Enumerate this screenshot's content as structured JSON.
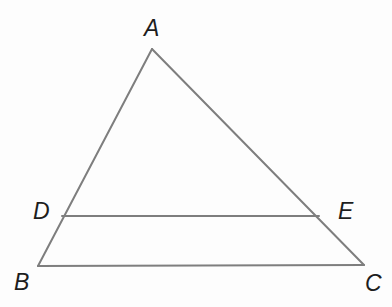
{
  "figure": {
    "kind": "geometry-diagram",
    "background_color": "#fdfdfd",
    "stroke_color": "#7e7e7e",
    "stroke_width": 2,
    "label_color": "#1d1d1d",
    "label_font_size": 23,
    "points": {
      "A": {
        "label": "A",
        "x": 152,
        "y": 49
      },
      "B": {
        "label": "B",
        "x": 38,
        "y": 266
      },
      "C": {
        "label": "C",
        "x": 364,
        "y": 265
      },
      "D": {
        "label": "D",
        "x": 62,
        "y": 216
      },
      "E": {
        "label": "E",
        "x": 319,
        "y": 216
      }
    },
    "segments": [
      {
        "name": "AB",
        "from": "A",
        "to": "B"
      },
      {
        "name": "AC",
        "from": "A",
        "to": "C"
      },
      {
        "name": "BC",
        "from": "B",
        "to": "C"
      },
      {
        "name": "DE",
        "from": "D",
        "to": "E"
      }
    ]
  }
}
